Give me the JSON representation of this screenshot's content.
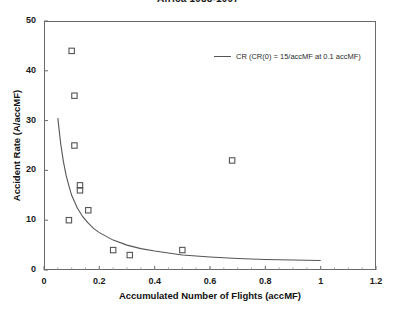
{
  "chart": {
    "title": "Africa 1988-1997",
    "xlabel": "Accumulated Number of Flights (accMF)",
    "ylabel": "Accident Rate (A/accMF)",
    "legend": {
      "marker": "line-segment",
      "label": "CR (CR(0) = 15/accMF at 0.1 accMF)"
    }
  },
  "chart_data": {
    "type": "scatter",
    "title": "Africa 1988-1997",
    "xlabel": "Accumulated Number of Flights (accMF)",
    "ylabel": "Accident Rate (A/accMF)",
    "xlim": [
      0,
      1.2
    ],
    "ylim": [
      0,
      50
    ],
    "xticks": [
      0,
      0.2,
      0.4,
      0.6,
      0.8,
      1,
      1.2
    ],
    "xticklabels": [
      "0",
      "0.2",
      "0.4",
      "0.6",
      "0.8",
      "1",
      "1.2"
    ],
    "yticks": [
      0,
      10,
      20,
      30,
      40,
      50
    ],
    "yticklabels": [
      "0",
      "10",
      "20",
      "30",
      "40",
      "50"
    ],
    "grid": false,
    "legend_position": "upper right inside",
    "series": [
      {
        "name": "Accident rate observations",
        "type": "scatter",
        "marker": "open-square",
        "color": "#555555",
        "points": [
          {
            "x": 0.1,
            "y": 44
          },
          {
            "x": 0.11,
            "y": 35
          },
          {
            "x": 0.11,
            "y": 25
          },
          {
            "x": 0.13,
            "y": 17
          },
          {
            "x": 0.13,
            "y": 16
          },
          {
            "x": 0.16,
            "y": 12
          },
          {
            "x": 0.09,
            "y": 10
          },
          {
            "x": 0.25,
            "y": 4
          },
          {
            "x": 0.31,
            "y": 3
          },
          {
            "x": 0.5,
            "y": 4
          },
          {
            "x": 0.68,
            "y": 22
          }
        ]
      },
      {
        "name": "CR (CR(0) = 15/accMF at 0.1 accMF)",
        "type": "line",
        "color": "#555555",
        "points": [
          {
            "x": 0.05,
            "y": 30.5
          },
          {
            "x": 0.06,
            "y": 25.5
          },
          {
            "x": 0.07,
            "y": 21.8
          },
          {
            "x": 0.08,
            "y": 19.0
          },
          {
            "x": 0.09,
            "y": 16.9
          },
          {
            "x": 0.1,
            "y": 15.0
          },
          {
            "x": 0.12,
            "y": 12.5
          },
          {
            "x": 0.14,
            "y": 10.7
          },
          {
            "x": 0.16,
            "y": 9.4
          },
          {
            "x": 0.18,
            "y": 8.3
          },
          {
            "x": 0.2,
            "y": 7.5
          },
          {
            "x": 0.25,
            "y": 6.0
          },
          {
            "x": 0.3,
            "y": 5.0
          },
          {
            "x": 0.35,
            "y": 4.3
          },
          {
            "x": 0.4,
            "y": 3.8
          },
          {
            "x": 0.5,
            "y": 3.0
          },
          {
            "x": 0.6,
            "y": 2.6
          },
          {
            "x": 0.7,
            "y": 2.3
          },
          {
            "x": 0.8,
            "y": 2.1
          },
          {
            "x": 0.9,
            "y": 2.0
          },
          {
            "x": 1.0,
            "y": 1.9
          }
        ]
      }
    ]
  }
}
